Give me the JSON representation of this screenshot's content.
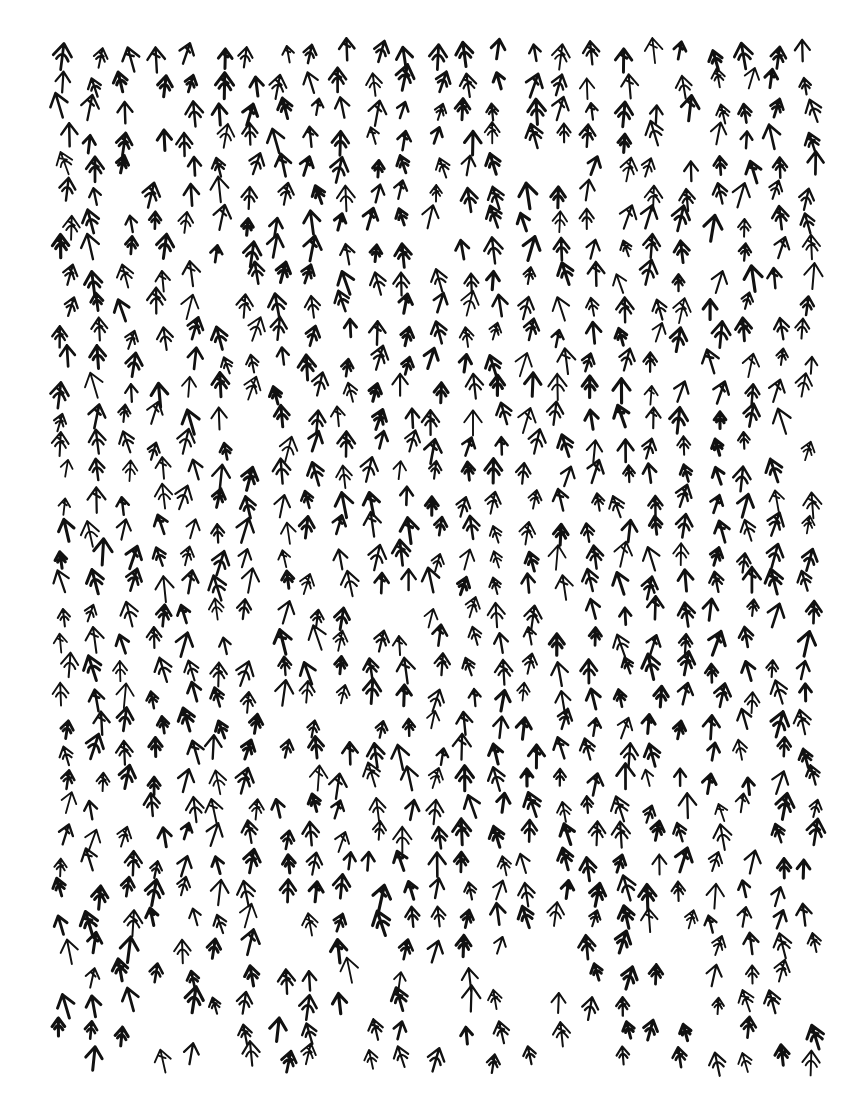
{
  "artwork": {
    "description": "Hand-drawn ink drawing of hundreds of small upward arrow / figure-like marks densely filling a rectangular field on white paper",
    "ink_color": "#111111",
    "paper_color": "#ffffff",
    "field": {
      "left": 50,
      "top": 45,
      "right": 810,
      "bottom": 1060
    },
    "mark_spacing": 31,
    "mark_size": 22
  }
}
